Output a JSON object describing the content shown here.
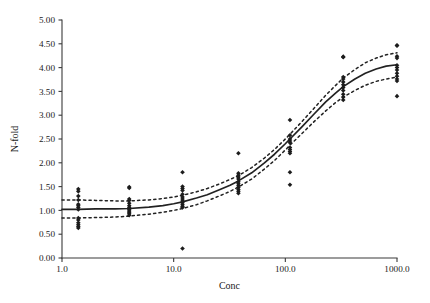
{
  "chart_data": {
    "type": "scatter",
    "title": "",
    "xlabel": "Conc",
    "ylabel": "N-fold",
    "xscale": "log",
    "yscale": "linear",
    "xlim": [
      1.0,
      1000.0
    ],
    "ylim": [
      0.0,
      5.0
    ],
    "grid": false,
    "legend": null,
    "x_ticks": [
      1.0,
      10.0,
      100.0,
      1000.0
    ],
    "x_tick_labels": [
      "1.0",
      "10.0",
      "100.0",
      "1000.0"
    ],
    "y_ticks": [
      0.0,
      0.5,
      1.0,
      1.5,
      2.0,
      2.5,
      3.0,
      3.5,
      4.0,
      4.5,
      5.0
    ],
    "y_tick_labels": [
      "0.00",
      "0.50",
      "1.00",
      "1.50",
      "2.00",
      "2.50",
      "3.00",
      "3.50",
      "4.00",
      "4.50",
      "5.00"
    ],
    "series": [
      {
        "name": "observations",
        "marker": "diamond",
        "color": "#1c1c1c",
        "points": [
          [
            1.4,
            1.45
          ],
          [
            1.4,
            1.4
          ],
          [
            1.4,
            1.3
          ],
          [
            1.4,
            1.22
          ],
          [
            1.4,
            1.13
          ],
          [
            1.4,
            1.1
          ],
          [
            1.4,
            1.06
          ],
          [
            1.4,
            1.02
          ],
          [
            1.4,
            0.84
          ],
          [
            1.4,
            0.8
          ],
          [
            1.4,
            0.74
          ],
          [
            1.4,
            0.7
          ],
          [
            1.4,
            0.66
          ],
          [
            1.4,
            0.63
          ],
          [
            4.0,
            1.49
          ],
          [
            4.0,
            1.47
          ],
          [
            4.0,
            1.24
          ],
          [
            4.0,
            1.21
          ],
          [
            4.0,
            1.15
          ],
          [
            4.0,
            1.1
          ],
          [
            4.0,
            1.06
          ],
          [
            4.0,
            1.02
          ],
          [
            4.0,
            0.99
          ],
          [
            4.0,
            0.96
          ],
          [
            4.0,
            0.93
          ],
          [
            4.0,
            0.9
          ],
          [
            12.0,
            1.8
          ],
          [
            12.0,
            1.5
          ],
          [
            12.0,
            1.46
          ],
          [
            12.0,
            1.42
          ],
          [
            12.0,
            1.34
          ],
          [
            12.0,
            1.28
          ],
          [
            12.0,
            1.24
          ],
          [
            12.0,
            1.2
          ],
          [
            12.0,
            1.16
          ],
          [
            12.0,
            1.12
          ],
          [
            12.0,
            1.08
          ],
          [
            12.0,
            1.06
          ],
          [
            12.0,
            0.2
          ],
          [
            38.0,
            2.2
          ],
          [
            38.0,
            1.78
          ],
          [
            38.0,
            1.74
          ],
          [
            38.0,
            1.7
          ],
          [
            38.0,
            1.66
          ],
          [
            38.0,
            1.6
          ],
          [
            38.0,
            1.56
          ],
          [
            38.0,
            1.52
          ],
          [
            38.0,
            1.48
          ],
          [
            38.0,
            1.44
          ],
          [
            38.0,
            1.4
          ],
          [
            38.0,
            1.36
          ],
          [
            110.0,
            2.9
          ],
          [
            110.0,
            2.58
          ],
          [
            110.0,
            2.5
          ],
          [
            110.0,
            2.46
          ],
          [
            110.0,
            2.42
          ],
          [
            110.0,
            2.32
          ],
          [
            110.0,
            2.28
          ],
          [
            110.0,
            2.24
          ],
          [
            110.0,
            2.2
          ],
          [
            110.0,
            1.8
          ],
          [
            110.0,
            1.54
          ],
          [
            330.0,
            4.23
          ],
          [
            330.0,
            4.22
          ],
          [
            330.0,
            3.8
          ],
          [
            330.0,
            3.76
          ],
          [
            330.0,
            3.7
          ],
          [
            330.0,
            3.64
          ],
          [
            330.0,
            3.58
          ],
          [
            330.0,
            3.52
          ],
          [
            330.0,
            3.44
          ],
          [
            330.0,
            3.38
          ],
          [
            330.0,
            3.32
          ],
          [
            1000.0,
            4.47
          ],
          [
            1000.0,
            4.46
          ],
          [
            1000.0,
            4.24
          ],
          [
            1000.0,
            4.2
          ],
          [
            1000.0,
            4.05
          ],
          [
            1000.0,
            4.0
          ],
          [
            1000.0,
            3.95
          ],
          [
            1000.0,
            3.88
          ],
          [
            1000.0,
            3.82
          ],
          [
            1000.0,
            3.76
          ],
          [
            1000.0,
            3.72
          ],
          [
            1000.0,
            3.4
          ]
        ]
      }
    ],
    "fit_curve": {
      "name": "sigmoid-fit",
      "style": "solid",
      "color": "#222222",
      "points": [
        [
          1.0,
          1.02
        ],
        [
          1.4,
          1.02
        ],
        [
          2.0,
          1.03
        ],
        [
          3.0,
          1.03
        ],
        [
          4.0,
          1.04
        ],
        [
          6.0,
          1.07
        ],
        [
          8.0,
          1.1
        ],
        [
          10.0,
          1.14
        ],
        [
          12.0,
          1.18
        ],
        [
          16.0,
          1.26
        ],
        [
          20.0,
          1.33
        ],
        [
          26.0,
          1.44
        ],
        [
          32.0,
          1.53
        ],
        [
          38.0,
          1.62
        ],
        [
          50.0,
          1.79
        ],
        [
          65.0,
          2.0
        ],
        [
          80.0,
          2.18
        ],
        [
          100.0,
          2.4
        ],
        [
          110.0,
          2.5
        ],
        [
          140.0,
          2.75
        ],
        [
          180.0,
          3.02
        ],
        [
          230.0,
          3.28
        ],
        [
          280.0,
          3.46
        ],
        [
          330.0,
          3.6
        ],
        [
          420.0,
          3.76
        ],
        [
          520.0,
          3.88
        ],
        [
          650.0,
          3.97
        ],
        [
          800.0,
          4.03
        ],
        [
          1000.0,
          4.06
        ]
      ]
    },
    "confidence_bands": [
      {
        "name": "upper-confidence-band",
        "style": "dashed",
        "color": "#222222",
        "points": [
          [
            1.0,
            1.22
          ],
          [
            1.4,
            1.22
          ],
          [
            2.0,
            1.21
          ],
          [
            3.0,
            1.2
          ],
          [
            4.0,
            1.2
          ],
          [
            6.0,
            1.22
          ],
          [
            8.0,
            1.25
          ],
          [
            10.0,
            1.28
          ],
          [
            12.0,
            1.32
          ],
          [
            16.0,
            1.39
          ],
          [
            20.0,
            1.46
          ],
          [
            26.0,
            1.56
          ],
          [
            32.0,
            1.65
          ],
          [
            38.0,
            1.73
          ],
          [
            50.0,
            1.9
          ],
          [
            65.0,
            2.1
          ],
          [
            80.0,
            2.28
          ],
          [
            100.0,
            2.5
          ],
          [
            110.0,
            2.6
          ],
          [
            140.0,
            2.86
          ],
          [
            180.0,
            3.14
          ],
          [
            230.0,
            3.42
          ],
          [
            280.0,
            3.62
          ],
          [
            330.0,
            3.78
          ],
          [
            420.0,
            3.96
          ],
          [
            520.0,
            4.1
          ],
          [
            650.0,
            4.2
          ],
          [
            800.0,
            4.27
          ],
          [
            1000.0,
            4.31
          ]
        ]
      },
      {
        "name": "lower-confidence-band",
        "style": "dashed",
        "color": "#222222",
        "points": [
          [
            1.0,
            0.84
          ],
          [
            1.4,
            0.84
          ],
          [
            2.0,
            0.85
          ],
          [
            3.0,
            0.86
          ],
          [
            4.0,
            0.88
          ],
          [
            6.0,
            0.92
          ],
          [
            8.0,
            0.96
          ],
          [
            10.0,
            1.0
          ],
          [
            12.0,
            1.04
          ],
          [
            16.0,
            1.12
          ],
          [
            20.0,
            1.2
          ],
          [
            26.0,
            1.31
          ],
          [
            32.0,
            1.4
          ],
          [
            38.0,
            1.49
          ],
          [
            50.0,
            1.66
          ],
          [
            65.0,
            1.87
          ],
          [
            80.0,
            2.05
          ],
          [
            100.0,
            2.27
          ],
          [
            110.0,
            2.37
          ],
          [
            140.0,
            2.61
          ],
          [
            180.0,
            2.86
          ],
          [
            230.0,
            3.09
          ],
          [
            280.0,
            3.26
          ],
          [
            330.0,
            3.38
          ],
          [
            420.0,
            3.52
          ],
          [
            520.0,
            3.63
          ],
          [
            650.0,
            3.71
          ],
          [
            800.0,
            3.76
          ],
          [
            1000.0,
            3.8
          ]
        ]
      }
    ]
  },
  "geometry": {
    "plot_left": 62,
    "plot_right": 397,
    "plot_top": 20,
    "plot_bottom": 258
  },
  "style": {
    "axis_color": "#3a3a3a",
    "marker_color": "#1c1c1c",
    "curve_color": "#222222",
    "background": "#ffffff"
  }
}
